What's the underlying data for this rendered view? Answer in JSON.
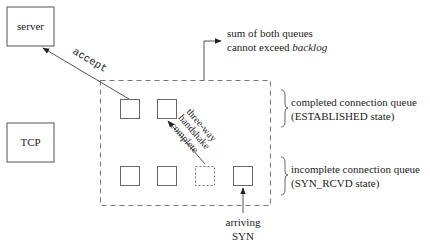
{
  "diagram": {
    "nodes": {
      "server": {
        "label": "server"
      },
      "tcp": {
        "label": "TCP"
      }
    },
    "edges": {
      "accept": {
        "label": "accept"
      },
      "handshake": {
        "lines": [
          "three-way",
          "handshake",
          "complete"
        ]
      },
      "arriving": {
        "lines": [
          "arriving",
          "SYN"
        ]
      }
    },
    "backlog_note": {
      "line1": "sum of both queues",
      "line2_prefix": "cannot exceed ",
      "line2_emphasis": "backlog"
    },
    "queues": {
      "completed": {
        "title": "completed connection queue",
        "state": "(ESTABLISHED state)",
        "slots": 2
      },
      "incomplete": {
        "title": "incomplete connection queue",
        "state": "(SYN_RCVD state)",
        "slots": 4
      }
    }
  }
}
